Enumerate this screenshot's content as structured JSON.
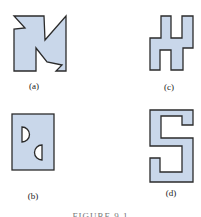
{
  "figure": {
    "colors": {
      "fill": "#c9d7ea",
      "stroke": "#2b2b2b",
      "hole_fill": "#ffffff"
    },
    "panels": [
      {
        "id": "a",
        "label": "(a)",
        "description": "pinwheel-like square with two diagonal notches"
      },
      {
        "id": "b",
        "label": "(b)",
        "description": "rectangle with two D-shaped holes"
      },
      {
        "id": "c",
        "label": "(c)",
        "description": "H-like stepped polygon"
      },
      {
        "id": "d",
        "label": "(d)",
        "description": "S-shaped polygon"
      }
    ],
    "caption": "FIGURE 9.1"
  }
}
